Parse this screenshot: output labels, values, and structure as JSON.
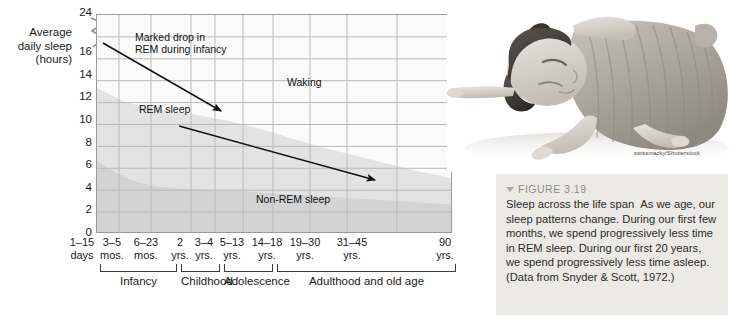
{
  "figure": {
    "number_label": "FIGURE 3.19",
    "triangle_icon": "triangle-down-icon",
    "title": "Sleep across the life span",
    "caption": "As we age, our sleep patterns change. During our first few months, we spend progressively less time in REM sleep. During our first 20 years, we spend progressively less time asleep. (Data from Snyder & Scott, 1972.)",
    "photo_credit": "swissmacky/Shutterstock",
    "photo_alt": "sleeping-child-photo",
    "caption_bg": "#eceae7"
  },
  "chart_data": {
    "type": "area",
    "title": "Sleep across the life span",
    "ylabel": "Average daily sleep (hours)",
    "xlabel": "",
    "ylim": [
      0,
      24
    ],
    "grid": true,
    "legend": "in-plot labels",
    "yticks": [
      0,
      2,
      4,
      6,
      8,
      10,
      12,
      14,
      16,
      24
    ],
    "y_axis_break_after": 16,
    "categories": [
      "1–15 days",
      "3–5 mos.",
      "6–23 mos.",
      "2 yrs.",
      "3–4 yrs.",
      "5–13 yrs.",
      "14–18 yrs.",
      "19–30 yrs.",
      "31–45 yrs.",
      "90 yrs."
    ],
    "series": [
      {
        "name": "REM sleep",
        "values": [
          8.0,
          6.0,
          4.5,
          3.2,
          2.6,
          2.2,
          2.0,
          1.9,
          1.8,
          1.2
        ]
      },
      {
        "name": "Non-REM sleep",
        "values": [
          8.0,
          8.5,
          8.5,
          8.3,
          8.2,
          8.0,
          6.5,
          6.0,
          5.8,
          4.5
        ]
      },
      {
        "name": "Waking",
        "values": [
          8.0,
          9.5,
          11.0,
          12.5,
          13.2,
          13.8,
          15.5,
          16.1,
          16.4,
          18.3
        ]
      }
    ],
    "total_sleep_hours": [
      16.0,
      14.5,
      13.0,
      11.5,
      10.8,
      10.2,
      8.5,
      7.9,
      7.6,
      5.7
    ],
    "nonrem_boundary_hours": [
      8.0,
      8.5,
      8.5,
      8.3,
      8.2,
      8.0,
      6.5,
      6.0,
      5.8,
      4.5
    ],
    "region_labels": [
      {
        "name": "rem-sleep",
        "text": "REM sleep"
      },
      {
        "name": "non-rem-sleep",
        "text": "Non-REM sleep"
      },
      {
        "name": "waking",
        "text": "Waking"
      }
    ],
    "annotations": [
      {
        "name": "marked-drop-annotation",
        "line1": "Marked drop in",
        "line2": "REM during infancy"
      }
    ],
    "stages": [
      {
        "name": "infancy",
        "label": "Infancy"
      },
      {
        "name": "childhood",
        "label": "Childhood"
      },
      {
        "name": "adolescence",
        "label": "Adolescence"
      },
      {
        "name": "adulthood",
        "label": "Adulthood and old age"
      }
    ],
    "colors": {
      "plot_bg": "#f0f0f0",
      "grid": "#b7b7b7",
      "axis": "#8f8f8f",
      "waking_fill": "#fafafa",
      "nonrem_fill": "#e2e2e2",
      "rem_fill": "#d2d2d2",
      "arrow": "#111111"
    }
  },
  "y_axis_title": {
    "line1": "Average",
    "line2": "daily sleep",
    "line3": "(hours)"
  }
}
